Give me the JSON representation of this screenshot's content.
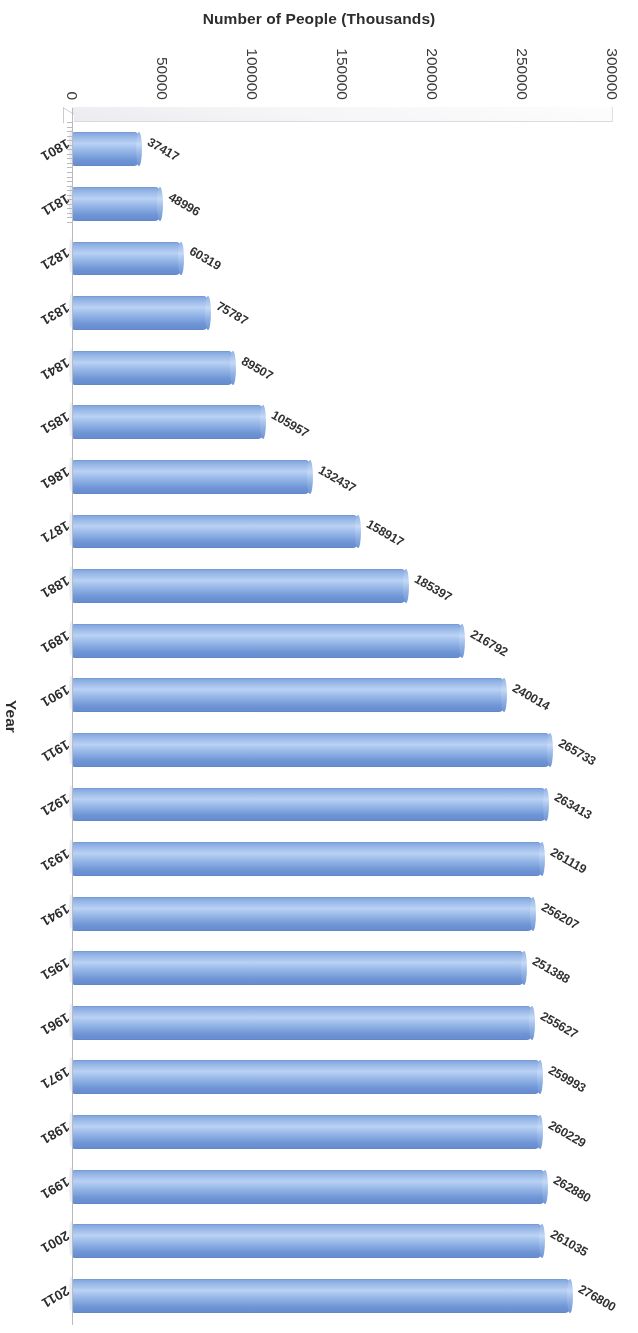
{
  "chart_data": {
    "type": "bar",
    "orientation": "vertical",
    "title": "",
    "xlabel": "Year",
    "ylabel": "Number of People (Thousands)",
    "ylim": [
      0,
      300000
    ],
    "ytick_labels": [
      "300000",
      "250000",
      "200000",
      "150000",
      "100000",
      "50000",
      "0"
    ],
    "ytick_values": [
      300000,
      250000,
      200000,
      150000,
      100000,
      50000,
      0
    ],
    "grid": false,
    "legend": false,
    "series_color": "#7ba3de",
    "categories": [
      "1801",
      "1811",
      "1821",
      "1831",
      "1841",
      "1851",
      "1861",
      "1871",
      "1881",
      "1891",
      "1901",
      "1911",
      "1921",
      "1931",
      "1941",
      "1951",
      "1961",
      "1971",
      "1981",
      "1991",
      "2001",
      "2011"
    ],
    "values": [
      37417,
      48996,
      60319,
      75787,
      89507,
      105957,
      132437,
      158917,
      185397,
      216792,
      240014,
      265733,
      263413,
      261119,
      256207,
      251388,
      255627,
      259993,
      260229,
      262880,
      261035,
      276800
    ],
    "data_labels": [
      "37417",
      "48996",
      "60319",
      "75787",
      "89507",
      "105957",
      "132437",
      "158917",
      "185397",
      "216792",
      "240014",
      "265733",
      "263413",
      "261119",
      "256207",
      "251388",
      "255627",
      "259993",
      "260229",
      "262880",
      "261035",
      "276800"
    ]
  }
}
